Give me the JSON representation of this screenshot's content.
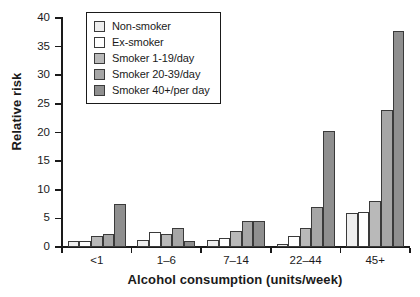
{
  "chart_data": {
    "type": "bar",
    "title": "",
    "xlabel": "Alcohol consumption (units/week)",
    "ylabel": "Relative risk",
    "categories": [
      "<1",
      "1–6",
      "7–14",
      "22–44",
      "45+"
    ],
    "ylim": [
      0,
      40
    ],
    "yticks": [
      0,
      5,
      10,
      15,
      20,
      25,
      30,
      35,
      40
    ],
    "ytick_labels": [
      "0",
      "5",
      "10",
      "15",
      "20",
      "25",
      "30",
      "35",
      "40"
    ],
    "grid": false,
    "legend_position": "top-left",
    "series": [
      {
        "name": "Non-smoker",
        "color": "#eeeeee",
        "values": [
          1.0,
          1.3,
          1.3,
          0.5,
          6.0
        ]
      },
      {
        "name": "Ex-smoker",
        "color": "#ffffff",
        "values": [
          1.0,
          2.6,
          1.5,
          2.0,
          6.1
        ]
      },
      {
        "name": "Smoker 1-19/day",
        "color": "#b9b9b9",
        "values": [
          2.0,
          2.2,
          2.8,
          3.4,
          8.0
        ]
      },
      {
        "name": "Smoker 20-39/day",
        "color": "#a6a6a6",
        "values": [
          2.3,
          3.4,
          4.6,
          7.0,
          24.0
        ]
      },
      {
        "name": "Smoker 40+/per day",
        "color": "#8f8f8f",
        "values": [
          7.5,
          1.1,
          4.6,
          20.2,
          37.8
        ]
      }
    ]
  },
  "legend": {
    "items": [
      {
        "label": "Non-smoker"
      },
      {
        "label": "Ex-smoker"
      },
      {
        "label": "Smoker 1-19/day"
      },
      {
        "label": "Smoker 20-39/day"
      },
      {
        "label": "Smoker 40+/per day"
      }
    ]
  }
}
